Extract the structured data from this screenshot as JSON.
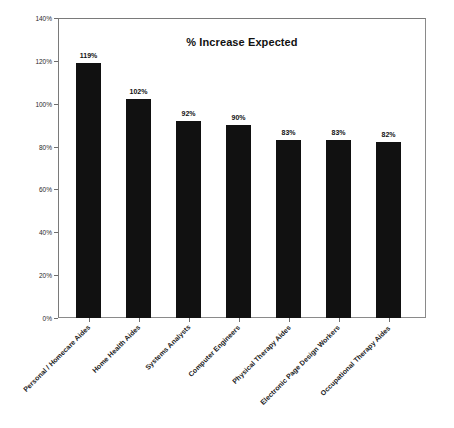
{
  "chart_data": {
    "type": "bar",
    "title": "% Increase Expected",
    "xlabel": "",
    "ylabel": "",
    "ylim": [
      0,
      140
    ],
    "ytick_step": 20,
    "ytick_labels": [
      "0%",
      "20%",
      "40%",
      "60%",
      "80%",
      "100%",
      "120%",
      "140%"
    ],
    "ytick_values": [
      0,
      20,
      40,
      60,
      80,
      100,
      120,
      140
    ],
    "grid": false,
    "legend": "none",
    "bar_color": "#111111",
    "categories": [
      "Personal / Homecare Aides",
      "Home Health Aides",
      "Systems Analysts",
      "Computer Engineers",
      "Physical Therapy Aides",
      "Electronic Page Design Workers",
      "Occupational Therapy Aides"
    ],
    "values": [
      119,
      102,
      92,
      90,
      83,
      83,
      82
    ],
    "data_labels": [
      "119%",
      "102%",
      "92%",
      "90%",
      "83%",
      "83%",
      "82%"
    ]
  },
  "frame": {
    "border_color": "#8a8a8a",
    "background": "#ffffff"
  }
}
